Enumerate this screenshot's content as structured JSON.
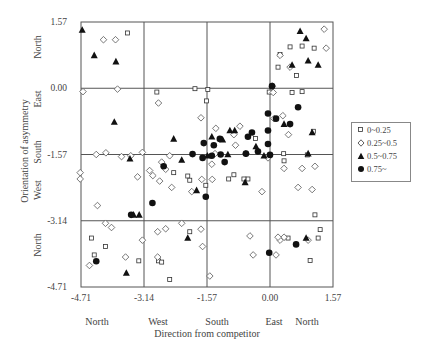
{
  "chart_data": {
    "type": "scatter",
    "title": "",
    "xlabel": "Direction from competitor",
    "ylabel": "Orientation of asymmetry",
    "xlim": [
      -4.71,
      1.57
    ],
    "ylim": [
      -4.71,
      1.57
    ],
    "xticks": [
      "-4.71",
      "-3.14",
      "-1.57",
      "0.00",
      "1.57"
    ],
    "yticks": [
      "1.57",
      "0.00",
      "-1.57",
      "-3.14",
      "-4.71"
    ],
    "xtick_values": [
      -4.71,
      -3.14,
      -1.57,
      0.0,
      1.57
    ],
    "ytick_values": [
      1.57,
      0.0,
      -1.57,
      -3.14,
      -4.71
    ],
    "x_direction_labels": [
      "North",
      "West",
      "South",
      "East",
      "North"
    ],
    "y_direction_labels": [
      "North",
      "East",
      "South",
      "West",
      "North"
    ],
    "grid": true,
    "legend_position": "right",
    "series": [
      {
        "name": "0~0.25",
        "marker": "square",
        "points": [
          [
            -3.55,
            1.31
          ],
          [
            -4.45,
            -3.55
          ],
          [
            -4.38,
            -3.95
          ],
          [
            -4.1,
            -3.75
          ],
          [
            -2.78,
            -4.09
          ],
          [
            -3.27,
            -4.09
          ],
          [
            -1.87,
            -0.01
          ],
          [
            -1.55,
            -0.03
          ],
          [
            -1.58,
            -0.3
          ],
          [
            -2.82,
            -0.09
          ],
          [
            -0.02,
            -0.09
          ],
          [
            0.55,
            -0.1
          ],
          [
            1.08,
            -1.02
          ],
          [
            -0.36,
            -1.19
          ],
          [
            0.93,
            -1.58
          ],
          [
            0.8,
            -0.08
          ],
          [
            0.35,
            -1.72
          ],
          [
            -2.05,
            -2.08
          ],
          [
            -2.0,
            -2.18
          ],
          [
            -1.6,
            -2.3
          ],
          [
            -2.4,
            -2.0
          ],
          [
            -0.9,
            -2.05
          ],
          [
            -1.03,
            -2.15
          ],
          [
            -0.55,
            -2.15
          ],
          [
            -0.65,
            -2.15
          ],
          [
            1.12,
            -3.0
          ],
          [
            1.0,
            -4.08
          ],
          [
            0.34,
            -1.55
          ],
          [
            1.2,
            -3.55
          ],
          [
            1.25,
            -3.35
          ],
          [
            -2.0,
            -3.4
          ],
          [
            -2.7,
            -4.12
          ],
          [
            0.45,
            -3.55
          ],
          [
            1.1,
            0.95
          ],
          [
            0.8,
            1.0
          ],
          [
            0.66,
            0.3
          ],
          [
            0.5,
            0.98
          ],
          [
            0.2,
            0.5
          ],
          [
            0.25,
            0.8
          ],
          [
            -2.5,
            -4.53
          ]
        ]
      },
      {
        "name": "0.25~0.5",
        "marker": "diamond",
        "points": [
          [
            -4.15,
            1.15
          ],
          [
            -3.85,
            1.15
          ],
          [
            -3.8,
            -0.02
          ],
          [
            -4.66,
            -0.08
          ],
          [
            -4.33,
            -1.57
          ],
          [
            -4.09,
            -1.53
          ],
          [
            -3.7,
            -1.62
          ],
          [
            -3.47,
            -1.6
          ],
          [
            -3.18,
            -1.52
          ],
          [
            -4.73,
            -2.0
          ],
          [
            -4.73,
            -2.15
          ],
          [
            -3.3,
            -2.1
          ],
          [
            -4.3,
            -2.78
          ],
          [
            -4.1,
            -3.2
          ],
          [
            -3.95,
            -3.3
          ],
          [
            -3.18,
            -3.6
          ],
          [
            -4.5,
            -4.2
          ],
          [
            -3.6,
            -4.0
          ],
          [
            -3.0,
            -1.95
          ],
          [
            -2.92,
            -2.07
          ],
          [
            -2.75,
            -2.2
          ],
          [
            -2.45,
            -2.35
          ],
          [
            -2.8,
            -3.4
          ],
          [
            -2.6,
            -3.33
          ],
          [
            -2.2,
            -3.2
          ],
          [
            -1.68,
            -3.75
          ],
          [
            -2.8,
            -4.0
          ],
          [
            -2.5,
            -1.6
          ],
          [
            -2.78,
            -0.35
          ],
          [
            -1.72,
            -0.7
          ],
          [
            -1.35,
            -0.95
          ],
          [
            -1.37,
            -1.55
          ],
          [
            -1.45,
            -1.8
          ],
          [
            -2.7,
            -1.75
          ],
          [
            -2.6,
            -1.92
          ],
          [
            -1.7,
            -2.16
          ],
          [
            -1.44,
            -2.16
          ],
          [
            -1.95,
            -2.45
          ],
          [
            -1.72,
            -3.34
          ],
          [
            -1.5,
            -4.45
          ],
          [
            -0.6,
            -1.55
          ],
          [
            -0.86,
            -1.35
          ],
          [
            -0.9,
            -1.1
          ],
          [
            -0.75,
            -0.9
          ],
          [
            -0.05,
            -1.65
          ],
          [
            0.35,
            -1.9
          ],
          [
            0.8,
            -1.9
          ],
          [
            1.12,
            -1.85
          ],
          [
            0.7,
            -2.35
          ],
          [
            1.05,
            -2.4
          ],
          [
            -0.2,
            -2.45
          ],
          [
            0.25,
            -3.6
          ],
          [
            -0.5,
            -3.5
          ],
          [
            -0.42,
            -3.95
          ],
          [
            0.15,
            -3.95
          ],
          [
            0.08,
            -0.1
          ],
          [
            0.32,
            -0.65
          ],
          [
            0.46,
            -1.1
          ],
          [
            0.1,
            -0.72
          ],
          [
            1.35,
            1.4
          ],
          [
            1.4,
            0.95
          ],
          [
            0.5,
            0.5
          ],
          [
            0.06,
            0.05
          ],
          [
            0.25,
            0.78
          ],
          [
            0.35,
            -3.53
          ],
          [
            0.95,
            -3.6
          ],
          [
            0.2,
            -3.53
          ]
        ]
      },
      {
        "name": "0.5~0.75",
        "marker": "triangle",
        "points": [
          [
            -4.68,
            1.38
          ],
          [
            -4.38,
            0.78
          ],
          [
            -3.84,
            0.63
          ],
          [
            -3.88,
            -0.8
          ],
          [
            -3.49,
            -1.67
          ],
          [
            -3.4,
            -3.0
          ],
          [
            -3.26,
            -3.0
          ],
          [
            -3.58,
            -4.38
          ],
          [
            -2.4,
            -1.2
          ],
          [
            -2.05,
            -3.55
          ],
          [
            -1.45,
            -1.15
          ],
          [
            -1.18,
            -1.22
          ],
          [
            -0.88,
            -1.0
          ],
          [
            -1.0,
            -1.0
          ],
          [
            -0.35,
            -1.38
          ],
          [
            -1.05,
            -1.57
          ],
          [
            -2.2,
            -1.7
          ],
          [
            -1.83,
            -2.42
          ],
          [
            -0.62,
            -2.23
          ],
          [
            -1.56,
            -1.6
          ],
          [
            -0.15,
            -1.6
          ],
          [
            0.35,
            -0.85
          ],
          [
            0.55,
            0.55
          ],
          [
            0.75,
            1.35
          ],
          [
            0.9,
            1.18
          ],
          [
            0.95,
            0.65
          ],
          [
            1.2,
            0.55
          ],
          [
            1.05,
            -1.05
          ],
          [
            0.95,
            -1.55
          ],
          [
            0.9,
            -3.55
          ]
        ]
      },
      {
        "name": "0.75~",
        "marker": "circle",
        "points": [
          [
            -4.33,
            -4.1
          ],
          [
            -3.46,
            -3.0
          ],
          [
            -2.93,
            -2.72
          ],
          [
            -2.65,
            -1.85
          ],
          [
            -1.68,
            -1.65
          ],
          [
            -1.93,
            -1.56
          ],
          [
            -1.45,
            -1.6
          ],
          [
            -1.4,
            -1.35
          ],
          [
            -1.25,
            -1.2
          ],
          [
            -1.65,
            -1.3
          ],
          [
            -1.13,
            -1.75
          ],
          [
            -1.6,
            -2.57
          ],
          [
            -0.55,
            -1.15
          ],
          [
            -0.45,
            -1.05
          ],
          [
            -0.3,
            -1.5
          ],
          [
            -0.6,
            -1.55
          ],
          [
            0.0,
            -1.58
          ],
          [
            -0.05,
            -1.32
          ],
          [
            0.05,
            0.05
          ],
          [
            -0.05,
            -0.6
          ],
          [
            0.15,
            -0.72
          ],
          [
            -0.05,
            -1.0
          ],
          [
            0.5,
            -0.85
          ],
          [
            -0.02,
            -3.9
          ],
          [
            0.7,
            -0.45
          ],
          [
            0.65,
            -3.7
          ],
          [
            -1.23,
            -1.57
          ]
        ]
      }
    ],
    "legend": [
      {
        "label": "0~0.25",
        "marker": "square"
      },
      {
        "label": "0.25~0.5",
        "marker": "diamond"
      },
      {
        "label": "0.5~0.75",
        "marker": "triangle"
      },
      {
        "label": "0.75~",
        "marker": "circle"
      }
    ]
  }
}
